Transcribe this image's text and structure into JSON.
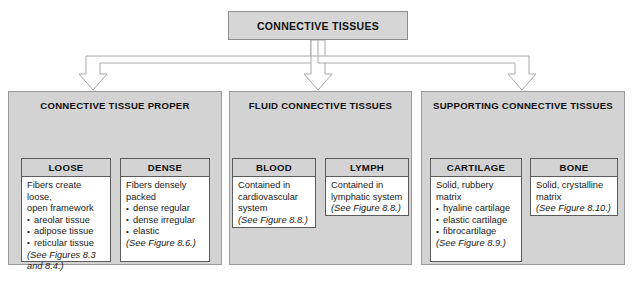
{
  "diagram": {
    "root": {
      "label": "CONNECTIVE TISSUES"
    },
    "groups": [
      {
        "id": "connective-tissue-proper",
        "title": "CONNECTIVE TISSUE PROPER",
        "cards": [
          {
            "id": "loose",
            "title": "LOOSE",
            "lead": "Fibers create loose,\n open framework",
            "items": [
              "areolar tissue",
              "adipose tissue",
              "reticular tissue"
            ],
            "figure_reference": "(See Figures 8.3\nand 8.4.)"
          },
          {
            "id": "dense",
            "title": "DENSE",
            "lead": "Fibers densely\npacked",
            "items": [
              "dense regular",
              "dense irregular",
              "elastic"
            ],
            "figure_reference": "(See Figure 8.6.)"
          }
        ]
      },
      {
        "id": "fluid-connective-tissues",
        "title": "FLUID CONNECTIVE TISSUES",
        "cards": [
          {
            "id": "blood",
            "title": "BLOOD",
            "lead": "Contained in\ncardiovascular\nsystem",
            "items": [],
            "figure_reference": "(See Figure 8.8.)"
          },
          {
            "id": "lymph",
            "title": "LYMPH",
            "lead": "Contained in\nlymphatic system",
            "items": [],
            "figure_reference": "(See Figure 8.8.)"
          }
        ]
      },
      {
        "id": "supporting-connective-tissues",
        "title": "SUPPORTING CONNECTIVE TISSUES",
        "cards": [
          {
            "id": "cartilage",
            "title": "CARTILAGE",
            "lead": "Solid, rubbery\nmatrix",
            "items": [
              "hyaline cartilage",
              "elastic cartilage",
              "fibrocartilage"
            ],
            "figure_reference": "(See Figure 8.9.)"
          },
          {
            "id": "bone",
            "title": "BONE",
            "lead": "Solid, crystalline\nmatrix",
            "items": [],
            "figure_reference": "(See Figure 8.10.)"
          }
        ]
      }
    ],
    "colors": {
      "panel_fill": "#d3d3d3",
      "root_fill": "#d6d6d6",
      "card_fill": "#ffffff",
      "card_header_fill": "#d3d3d3",
      "border": "#5c5c5c",
      "connector_stroke": "#a8a8a8",
      "text": "#111111"
    }
  }
}
